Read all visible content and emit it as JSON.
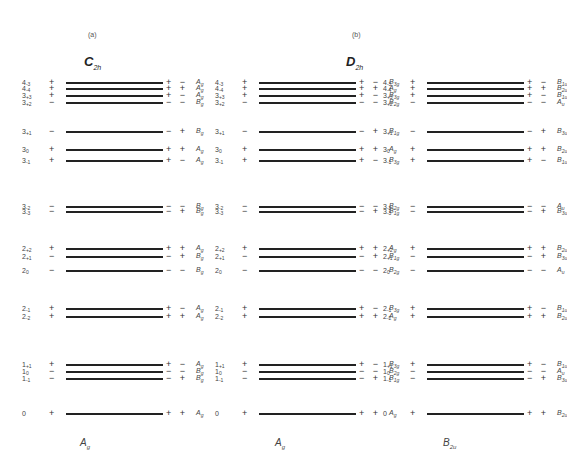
{
  "captions": {
    "a": "(a)",
    "b": "(b)"
  },
  "groups": {
    "c2h": {
      "main": "C",
      "sub": "2h"
    },
    "d2h": {
      "main": "D",
      "sub": "2h"
    }
  },
  "columns": [
    {
      "name": "C2h",
      "bottom_label": {
        "main": "A",
        "sub": "g"
      },
      "levels": [
        {
          "n": "4",
          "m": "-3",
          "y": 82,
          "l": "+",
          "r": "+ −",
          "sym": "A",
          "sub": "g"
        },
        {
          "n": "4",
          "m": "-4",
          "y": 88,
          "l": "+",
          "r": "+ +",
          "sym": "A",
          "sub": "g"
        },
        {
          "n": "3",
          "m": "+3",
          "y": 95,
          "l": "+",
          "r": "+ −",
          "sym": "A",
          "sub": "g"
        },
        {
          "n": "3",
          "m": "+2",
          "y": 102,
          "l": "−",
          "r": "− −",
          "sym": "B",
          "sub": "g"
        },
        {
          "n": "3",
          "m": "+1",
          "y": 131,
          "l": "−",
          "r": "− +",
          "sym": "B",
          "sub": "g"
        },
        {
          "n": "3",
          "m": "0",
          "y": 149,
          "l": "+",
          "r": "+ +",
          "sym": "A",
          "sub": "g"
        },
        {
          "n": "3",
          "m": "-1",
          "y": 160,
          "l": "+",
          "r": "+ −",
          "sym": "A",
          "sub": "g"
        },
        {
          "n": "3",
          "m": "-2",
          "y": 206,
          "l": "−",
          "r": "− −",
          "sym": "B",
          "sub": "g"
        },
        {
          "n": "3",
          "m": "-3",
          "y": 211,
          "l": "−",
          "r": "− +",
          "sym": "B",
          "sub": "g"
        },
        {
          "n": "2",
          "m": "+2",
          "y": 248,
          "l": "+",
          "r": "+ +",
          "sym": "A",
          "sub": "g"
        },
        {
          "n": "2",
          "m": "+1",
          "y": 256,
          "l": "−",
          "r": "− +",
          "sym": "B",
          "sub": "g"
        },
        {
          "n": "2",
          "m": "0",
          "y": 270,
          "l": "−",
          "r": "− −",
          "sym": "B",
          "sub": "g"
        },
        {
          "n": "2",
          "m": "-1",
          "y": 308,
          "l": "+",
          "r": "+ −",
          "sym": "A",
          "sub": "g"
        },
        {
          "n": "2",
          "m": "-2",
          "y": 316,
          "l": "+",
          "r": "+ +",
          "sym": "A",
          "sub": "g"
        },
        {
          "n": "1",
          "m": "+1",
          "y": 364,
          "l": "+",
          "r": "+ −",
          "sym": "A",
          "sub": "g"
        },
        {
          "n": "1",
          "m": "0",
          "y": 371,
          "l": "−",
          "r": "− −",
          "sym": "B",
          "sub": "g"
        },
        {
          "n": "1",
          "m": "-1",
          "y": 378,
          "l": "−",
          "r": "− +",
          "sym": "B",
          "sub": "g"
        },
        {
          "n": "0",
          "m": "",
          "y": 413,
          "l": "+",
          "r": "+ +",
          "sym": "A",
          "sub": "g"
        }
      ]
    },
    {
      "name": "D2h-Ag",
      "bottom_label": {
        "main": "A",
        "sub": "g"
      },
      "levels": [
        {
          "n": "4",
          "m": "-3",
          "y": 82,
          "l": "+",
          "r": "+ −",
          "sym": "B",
          "sub": "3g"
        },
        {
          "n": "4",
          "m": "-4",
          "y": 88,
          "l": "+",
          "r": "+ +",
          "sym": "A",
          "sub": "g"
        },
        {
          "n": "3",
          "m": "+3",
          "y": 95,
          "l": "+",
          "r": "+ −",
          "sym": "B",
          "sub": "3g"
        },
        {
          "n": "3",
          "m": "+2",
          "y": 102,
          "l": "−",
          "r": "− −",
          "sym": "B",
          "sub": "2g"
        },
        {
          "n": "3",
          "m": "+1",
          "y": 131,
          "l": "−",
          "r": "− +",
          "sym": "B",
          "sub": "1g"
        },
        {
          "n": "3",
          "m": "0",
          "y": 149,
          "l": "+",
          "r": "+ +",
          "sym": "A",
          "sub": "g"
        },
        {
          "n": "3",
          "m": "-1",
          "y": 160,
          "l": "+",
          "r": "+ −",
          "sym": "B",
          "sub": "3g"
        },
        {
          "n": "3",
          "m": "-2",
          "y": 206,
          "l": "−",
          "r": "− −",
          "sym": "B",
          "sub": "2g"
        },
        {
          "n": "3",
          "m": "-3",
          "y": 211,
          "l": "−",
          "r": "− +",
          "sym": "B",
          "sub": "1g"
        },
        {
          "n": "2",
          "m": "+2",
          "y": 248,
          "l": "+",
          "r": "+ +",
          "sym": "A",
          "sub": "g"
        },
        {
          "n": "2",
          "m": "+1",
          "y": 256,
          "l": "−",
          "r": "− +",
          "sym": "B",
          "sub": "1g"
        },
        {
          "n": "2",
          "m": "0",
          "y": 270,
          "l": "−",
          "r": "− −",
          "sym": "B",
          "sub": "2g"
        },
        {
          "n": "2",
          "m": "-1",
          "y": 308,
          "l": "+",
          "r": "+ −",
          "sym": "B",
          "sub": "3g"
        },
        {
          "n": "2",
          "m": "-2",
          "y": 316,
          "l": "+",
          "r": "+ +",
          "sym": "A",
          "sub": "g"
        },
        {
          "n": "1",
          "m": "+1",
          "y": 364,
          "l": "+",
          "r": "+ −",
          "sym": "B",
          "sub": "3g"
        },
        {
          "n": "1",
          "m": "0",
          "y": 371,
          "l": "−",
          "r": "− −",
          "sym": "B",
          "sub": "2g"
        },
        {
          "n": "1",
          "m": "-1",
          "y": 378,
          "l": "−",
          "r": "− +",
          "sym": "B",
          "sub": "1g"
        },
        {
          "n": "0",
          "m": "",
          "y": 413,
          "l": "+",
          "r": "+ +",
          "sym": "A",
          "sub": "g"
        }
      ]
    },
    {
      "name": "D2h-B2u",
      "bottom_label": {
        "main": "B",
        "sub": "2u"
      },
      "levels": [
        {
          "n": "4",
          "m": "-3",
          "y": 82,
          "l": "+",
          "r": "+ −",
          "sym": "B",
          "sub": "1u"
        },
        {
          "n": "4",
          "m": "-4",
          "y": 88,
          "l": "+",
          "r": "+ +",
          "sym": "B",
          "sub": "2u"
        },
        {
          "n": "3",
          "m": "+3",
          "y": 95,
          "l": "+",
          "r": "+ −",
          "sym": "B",
          "sub": "1u"
        },
        {
          "n": "3",
          "m": "+2",
          "y": 102,
          "l": "−",
          "r": "− −",
          "sym": "A",
          "sub": "u"
        },
        {
          "n": "3",
          "m": "+1",
          "y": 131,
          "l": "−",
          "r": "− +",
          "sym": "B",
          "sub": "3u"
        },
        {
          "n": "3",
          "m": "0",
          "y": 149,
          "l": "+",
          "r": "+ +",
          "sym": "B",
          "sub": "2u"
        },
        {
          "n": "3",
          "m": "-1",
          "y": 160,
          "l": "+",
          "r": "+ −",
          "sym": "B",
          "sub": "1u"
        },
        {
          "n": "3",
          "m": "-2",
          "y": 206,
          "l": "−",
          "r": "− −",
          "sym": "A",
          "sub": "u"
        },
        {
          "n": "3",
          "m": "-3",
          "y": 211,
          "l": "−",
          "r": "− +",
          "sym": "B",
          "sub": "3u"
        },
        {
          "n": "2",
          "m": "+2",
          "y": 248,
          "l": "+",
          "r": "+ +",
          "sym": "B",
          "sub": "2u"
        },
        {
          "n": "2",
          "m": "+1",
          "y": 256,
          "l": "−",
          "r": "− +",
          "sym": "B",
          "sub": "3u"
        },
        {
          "n": "2",
          "m": "0",
          "y": 270,
          "l": "−",
          "r": "− −",
          "sym": "A",
          "sub": "u"
        },
        {
          "n": "2",
          "m": "-1",
          "y": 308,
          "l": "+",
          "r": "+ −",
          "sym": "B",
          "sub": "1u"
        },
        {
          "n": "2",
          "m": "-2",
          "y": 316,
          "l": "+",
          "r": "+ +",
          "sym": "B",
          "sub": "2u"
        },
        {
          "n": "1",
          "m": "+1",
          "y": 364,
          "l": "+",
          "r": "+ −",
          "sym": "B",
          "sub": "1u"
        },
        {
          "n": "1",
          "m": "0",
          "y": 371,
          "l": "−",
          "r": "− −",
          "sym": "A",
          "sub": "u"
        },
        {
          "n": "1",
          "m": "-1",
          "y": 378,
          "l": "−",
          "r": "− +",
          "sym": "B",
          "sub": "3u"
        },
        {
          "n": "0",
          "m": "",
          "y": 413,
          "l": "+",
          "r": "+ +",
          "sym": "B",
          "sub": "2u"
        }
      ]
    }
  ]
}
